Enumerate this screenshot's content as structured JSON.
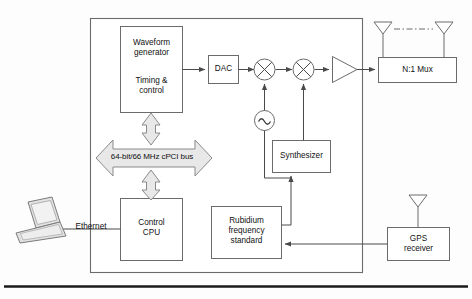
{
  "diagram": {
    "type": "block-diagram",
    "colors": {
      "background": "#fdfdfd",
      "stroke": "#6b6b6b",
      "stroke_dark": "#4a4a4a",
      "box_fill": "#ffffff",
      "arrow_fill": "#e8e8e8",
      "laptop_fill": "#e2e2e2",
      "rule": "#1a1a1a"
    },
    "chassis": {
      "label": ""
    },
    "blocks": [
      {
        "id": "waveform",
        "label_lines": [
          "Waveform",
          "generator",
          "",
          "Timing &",
          "control"
        ]
      },
      {
        "id": "dac",
        "label_lines": [
          "DAC"
        ]
      },
      {
        "id": "synthesizer",
        "label_lines": [
          "Synthesizer"
        ]
      },
      {
        "id": "rubidium",
        "label_lines": [
          "Rubidium",
          "frequency",
          "standard"
        ]
      },
      {
        "id": "control-cpu",
        "label_lines": [
          "Control",
          "CPU"
        ]
      },
      {
        "id": "mux",
        "label_lines": [
          "N:1 Mux"
        ]
      },
      {
        "id": "gps",
        "label_lines": [
          "GPS",
          "receiver"
        ]
      }
    ],
    "labels": {
      "waveform_1": "Waveform",
      "waveform_2": "generator",
      "waveform_3": "Timing &",
      "waveform_4": "control",
      "dac": "DAC",
      "bus": "64-bit/66 MHz cPCI bus",
      "synthesizer": "Synthesizer",
      "rubidium_1": "Rubidium",
      "rubidium_2": "frequency",
      "rubidium_3": "standard",
      "control_1": "Control",
      "control_2": "CPU",
      "ethernet": "Ethernet",
      "mux": "N:1 Mux",
      "gps_1": "GPS",
      "gps_2": "receiver"
    },
    "symbols": [
      {
        "id": "mixer-1",
        "name": "mixer-icon",
        "glyph": "circle-x"
      },
      {
        "id": "mixer-2",
        "name": "mixer-icon",
        "glyph": "circle-x"
      },
      {
        "id": "oscillator",
        "name": "oscillator-icon",
        "glyph": "circle-sine"
      },
      {
        "id": "amplifier",
        "name": "amplifier-icon",
        "glyph": "triangle"
      },
      {
        "id": "antenna-left",
        "name": "antenna-icon",
        "glyph": "antenna"
      },
      {
        "id": "antenna-right",
        "name": "antenna-icon",
        "glyph": "antenna"
      },
      {
        "id": "antenna-gps",
        "name": "antenna-icon",
        "glyph": "antenna"
      },
      {
        "id": "laptop",
        "name": "laptop-icon",
        "glyph": "laptop"
      },
      {
        "id": "bus-arrow",
        "name": "bus-arrow-icon",
        "glyph": "double-arrow-horizontal"
      },
      {
        "id": "bus-link-top",
        "name": "bus-link-icon",
        "glyph": "double-arrow-vertical"
      },
      {
        "id": "bus-link-bot",
        "name": "bus-link-icon",
        "glyph": "double-arrow-vertical"
      },
      {
        "id": "antenna-link",
        "name": "dash-dot-link",
        "glyph": "dash-dot-line"
      }
    ]
  }
}
